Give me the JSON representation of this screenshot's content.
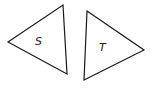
{
  "diagram": {
    "triangles": [
      {
        "label": "S",
        "points": "8,42 63,5 67,74",
        "label_pos": [
          38,
          45
        ]
      },
      {
        "label": "T",
        "points": "87,11 144,50 84,80",
        "label_pos": [
          102,
          51
        ]
      }
    ],
    "stroke_color": "#1a1a1a"
  }
}
